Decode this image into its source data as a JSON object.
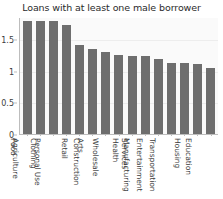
{
  "chart_data": {
    "type": "bar",
    "title": "Loans with at least one male borrower",
    "xlabel": "",
    "ylabel": "",
    "ylim": [
      0,
      1.85
    ],
    "yticks": [
      "0",
      "0.5",
      "1",
      "1.5"
    ],
    "ytick_values": [
      0,
      0.5,
      1,
      1.5
    ],
    "grid": true,
    "legend": "none",
    "bar_color": "#6e6e6e",
    "background_color": "#fafafa",
    "categories": [
      "Food",
      "Agriculture",
      "Clothing",
      "Personal Use",
      "Retail",
      "Arts",
      "Construction",
      "Wholesale",
      "Health",
      "Services",
      "Manufacturing",
      "Entertainment",
      "Transportation",
      "Housing",
      "Education"
    ],
    "values": [
      1.78,
      1.78,
      1.78,
      1.73,
      1.4,
      1.34,
      1.3,
      1.25,
      1.24,
      1.23,
      1.18,
      1.13,
      1.12,
      1.11,
      1.05
    ]
  }
}
